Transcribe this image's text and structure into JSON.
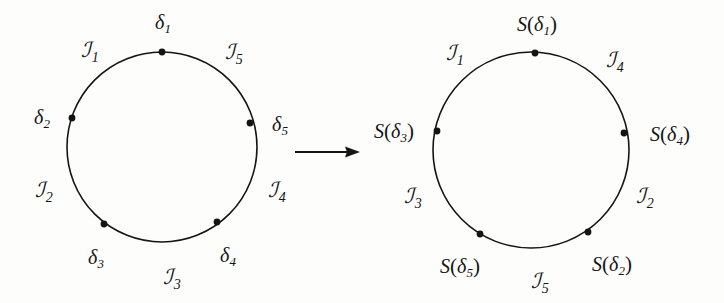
{
  "figure": {
    "background_color": "#fdfdfb",
    "stroke_color": "#141414"
  },
  "arrow": {
    "name": "maps-to-arrow",
    "symbol": "→",
    "x1": 295,
    "y1": 152,
    "x2": 360,
    "y2": 152
  },
  "left_circle": {
    "caption": "source circle",
    "center": [
      162,
      147
    ],
    "radius": 95,
    "points": [
      {
        "id": "d1",
        "base": "δ",
        "sub": "1",
        "angle_deg": 90,
        "label_x": 163,
        "label_y": 22,
        "dot_x": 162,
        "dot_y": 52
      },
      {
        "id": "d2",
        "base": "δ",
        "sub": "2",
        "angle_deg": 162,
        "label_x": 42,
        "label_y": 117,
        "dot_x": 72,
        "dot_y": 118
      },
      {
        "id": "d3",
        "base": "δ",
        "sub": "3",
        "angle_deg": 234,
        "label_x": 96,
        "label_y": 257,
        "dot_x": 104,
        "dot_y": 224
      },
      {
        "id": "d4",
        "base": "δ",
        "sub": "4",
        "angle_deg": 306,
        "label_x": 228,
        "label_y": 255,
        "dot_x": 217,
        "dot_y": 222
      },
      {
        "id": "d5",
        "base": "δ",
        "sub": "5",
        "angle_deg": 18,
        "label_x": 280,
        "label_y": 124,
        "dot_x": 250,
        "dot_y": 123
      }
    ],
    "arcs": [
      {
        "id": "I1",
        "base": "ℐ",
        "sub": "1",
        "label_x": 90,
        "label_y": 50
      },
      {
        "id": "I2",
        "base": "ℐ",
        "sub": "2",
        "label_x": 44,
        "label_y": 190
      },
      {
        "id": "I3",
        "base": "ℐ",
        "sub": "3",
        "label_x": 172,
        "label_y": 277
      },
      {
        "id": "I4",
        "base": "ℐ",
        "sub": "4",
        "label_x": 277,
        "label_y": 190
      },
      {
        "id": "I5",
        "base": "ℐ",
        "sub": "5",
        "label_x": 234,
        "label_y": 52
      }
    ]
  },
  "right_circle": {
    "caption": "image circle",
    "center": [
      531,
      150
    ],
    "radius": 98,
    "points": [
      {
        "id": "Sd1",
        "fn": "S",
        "open": "(",
        "base": "δ",
        "sub": "1",
        "close": ")",
        "label_x": 537,
        "label_y": 24,
        "dot_x": 535,
        "dot_y": 53
      },
      {
        "id": "Sd3",
        "fn": "S",
        "open": "(",
        "base": "δ",
        "sub": "3",
        "close": ")",
        "label_x": 394,
        "label_y": 131,
        "dot_x": 437,
        "dot_y": 131
      },
      {
        "id": "Sd4",
        "fn": "S",
        "open": "(",
        "base": "δ",
        "sub": "4",
        "close": ")",
        "label_x": 670,
        "label_y": 134,
        "dot_x": 624,
        "dot_y": 133
      },
      {
        "id": "Sd5",
        "fn": "S",
        "open": "(",
        "base": "δ",
        "sub": "5",
        "close": ")",
        "label_x": 460,
        "label_y": 266,
        "dot_x": 480,
        "dot_y": 234
      },
      {
        "id": "Sd2",
        "fn": "S",
        "open": "(",
        "base": "δ",
        "sub": "2",
        "close": ")",
        "label_x": 612,
        "label_y": 264,
        "dot_x": 588,
        "dot_y": 232
      }
    ],
    "arcs": [
      {
        "id": "I1",
        "base": "ℐ",
        "sub": "1",
        "label_x": 455,
        "label_y": 53
      },
      {
        "id": "I4",
        "base": "ℐ",
        "sub": "4",
        "label_x": 615,
        "label_y": 60
      },
      {
        "id": "I3",
        "base": "ℐ",
        "sub": "3",
        "label_x": 413,
        "label_y": 196
      },
      {
        "id": "I2",
        "base": "ℐ",
        "sub": "2",
        "label_x": 645,
        "label_y": 196
      },
      {
        "id": "I5",
        "base": "ℐ",
        "sub": "5",
        "label_x": 540,
        "label_y": 281
      }
    ]
  }
}
